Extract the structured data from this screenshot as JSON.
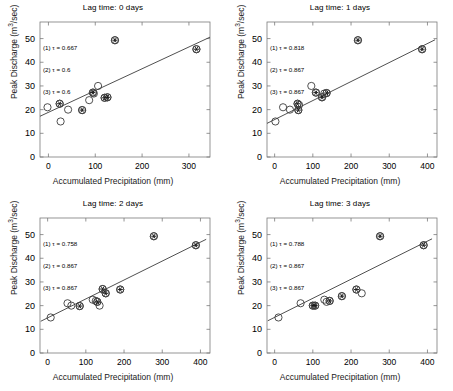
{
  "figure": {
    "panel_count": 4,
    "marker_colors": {
      "circle_stroke": "#3c3c3c",
      "asterisk": "#1a1a1a",
      "regression_line": "#3c3c3c",
      "axis": "#7a7a7a"
    }
  },
  "axes": {
    "xlabel": "Accumulated Precipitation (mm)",
    "ylabel_pre": "Peak Discharge (m",
    "ylabel_sup": "3",
    "ylabel_post": "/sec)"
  },
  "chart_data": [
    {
      "type": "scatter",
      "id": "panel-0",
      "title": "Lag time: 0 days",
      "xlabel": "Accumulated Precipitation (mm)",
      "ylabel": "Peak Discharge (m3/sec)",
      "xlim": [
        -18,
        345
      ],
      "ylim": [
        0,
        57
      ],
      "xticks": [
        0,
        100,
        200,
        300
      ],
      "yticks": [
        0,
        10,
        20,
        30,
        40,
        50
      ],
      "grid": false,
      "legend_position": "none",
      "annotations": [
        "(1) τ = 0.667",
        "(2) τ = 0.6",
        "(3) τ = 0.6"
      ],
      "regression_line": {
        "x": [
          -18,
          345
        ],
        "y": [
          17.2,
          50.6
        ]
      },
      "series": [
        {
          "name": "open-circle",
          "marker": "circle",
          "points": [
            {
              "x": -2,
              "y": 21.0
            },
            {
              "x": 26,
              "y": 15.0
            },
            {
              "x": 42,
              "y": 20.0
            },
            {
              "x": 87,
              "y": 24.0
            },
            {
              "x": 106,
              "y": 30.0
            },
            {
              "x": 95,
              "y": 27.2
            },
            {
              "x": 97,
              "y": 26.8
            },
            {
              "x": 120,
              "y": 25.0
            },
            {
              "x": 126,
              "y": 25.2
            },
            {
              "x": 24,
              "y": 22.5
            },
            {
              "x": 72,
              "y": 19.8
            },
            {
              "x": 142,
              "y": 49.3
            },
            {
              "x": 316,
              "y": 45.5
            }
          ]
        },
        {
          "name": "asterisk-overlay",
          "marker": "circle-asterisk",
          "points": [
            {
              "x": 24,
              "y": 22.5
            },
            {
              "x": 72,
              "y": 19.8
            },
            {
              "x": 95,
              "y": 27.2
            },
            {
              "x": 120,
              "y": 25.0
            },
            {
              "x": 126,
              "y": 25.2
            },
            {
              "x": 142,
              "y": 49.3
            },
            {
              "x": 316,
              "y": 45.5
            }
          ]
        }
      ]
    },
    {
      "type": "scatter",
      "id": "panel-1",
      "title": "Lag time: 1 days",
      "xlabel": "Accumulated Precipitation (mm)",
      "ylabel": "Peak Discharge (m3/sec)",
      "xlim": [
        -20,
        425
      ],
      "ylim": [
        0,
        57
      ],
      "xticks": [
        0,
        100,
        200,
        300,
        400
      ],
      "yticks": [
        0,
        10,
        20,
        30,
        40,
        50
      ],
      "grid": false,
      "legend_position": "none",
      "annotations": [
        "(1) τ = 0.818",
        "(2) τ = 0.867",
        "(3) τ = 0.867"
      ],
      "regression_line": {
        "x": [
          -20,
          420
        ],
        "y": [
          14.2,
          49.5
        ]
      },
      "series": [
        {
          "name": "open-circle",
          "marker": "circle",
          "points": [
            {
              "x": 2,
              "y": 15.0
            },
            {
              "x": 22,
              "y": 21.0
            },
            {
              "x": 40,
              "y": 20.0
            },
            {
              "x": 60,
              "y": 22.5
            },
            {
              "x": 64,
              "y": 22.0
            },
            {
              "x": 62,
              "y": 19.8
            },
            {
              "x": 108,
              "y": 27.2
            },
            {
              "x": 96,
              "y": 30.0
            },
            {
              "x": 124,
              "y": 25.2
            },
            {
              "x": 130,
              "y": 26.8
            },
            {
              "x": 136,
              "y": 27.0
            },
            {
              "x": 218,
              "y": 49.3
            },
            {
              "x": 386,
              "y": 45.5
            }
          ]
        },
        {
          "name": "asterisk-overlay",
          "marker": "circle-asterisk",
          "points": [
            {
              "x": 60,
              "y": 22.5
            },
            {
              "x": 62,
              "y": 19.8
            },
            {
              "x": 108,
              "y": 27.2
            },
            {
              "x": 124,
              "y": 25.2
            },
            {
              "x": 136,
              "y": 27.0
            },
            {
              "x": 218,
              "y": 49.3
            },
            {
              "x": 386,
              "y": 45.5
            }
          ]
        }
      ]
    },
    {
      "type": "scatter",
      "id": "panel-2",
      "title": "Lag time: 2 days",
      "xlabel": "Accumulated Precipitation (mm)",
      "ylabel": "Peak Discharge (m3/sec)",
      "xlim": [
        -20,
        425
      ],
      "ylim": [
        0,
        57
      ],
      "xticks": [
        0,
        100,
        200,
        300,
        400
      ],
      "yticks": [
        0,
        10,
        20,
        30,
        40,
        50
      ],
      "grid": false,
      "legend_position": "none",
      "annotations": [
        "(1) τ = 0.758",
        "(2) τ = 0.867",
        "(3) τ = 0.867"
      ],
      "regression_line": {
        "x": [
          -18,
          415
        ],
        "y": [
          13.4,
          48.0
        ]
      },
      "series": [
        {
          "name": "open-circle",
          "marker": "circle",
          "points": [
            {
              "x": 8,
              "y": 15.0
            },
            {
              "x": 52,
              "y": 21.0
            },
            {
              "x": 62,
              "y": 20.0
            },
            {
              "x": 84,
              "y": 19.8
            },
            {
              "x": 118,
              "y": 22.5
            },
            {
              "x": 126,
              "y": 22.0
            },
            {
              "x": 130,
              "y": 21.6
            },
            {
              "x": 136,
              "y": 20.0
            },
            {
              "x": 144,
              "y": 27.0
            },
            {
              "x": 152,
              "y": 25.2
            },
            {
              "x": 190,
              "y": 26.8
            },
            {
              "x": 278,
              "y": 49.3
            },
            {
              "x": 388,
              "y": 45.5
            }
          ]
        },
        {
          "name": "asterisk-overlay",
          "marker": "circle-asterisk",
          "points": [
            {
              "x": 84,
              "y": 19.8
            },
            {
              "x": 130,
              "y": 21.6
            },
            {
              "x": 144,
              "y": 27.0
            },
            {
              "x": 152,
              "y": 25.2
            },
            {
              "x": 190,
              "y": 26.8
            },
            {
              "x": 278,
              "y": 49.3
            },
            {
              "x": 388,
              "y": 45.5
            }
          ]
        }
      ]
    },
    {
      "type": "scatter",
      "id": "panel-3",
      "title": "Lag time: 3 days",
      "xlabel": "Accumulated Precipitation (mm)",
      "ylabel": "Peak Discharge (m3/sec)",
      "xlim": [
        -20,
        425
      ],
      "ylim": [
        0,
        57
      ],
      "xticks": [
        0,
        100,
        200,
        300,
        400
      ],
      "yticks": [
        0,
        10,
        20,
        30,
        40,
        50
      ],
      "grid": false,
      "legend_position": "none",
      "annotations": [
        "(1) τ = 0.788",
        "(2) τ = 0.867",
        "(3) τ = 0.867"
      ],
      "regression_line": {
        "x": [
          -18,
          412
        ],
        "y": [
          13.6,
          48.2
        ]
      },
      "series": [
        {
          "name": "open-circle",
          "marker": "circle",
          "points": [
            {
              "x": 10,
              "y": 15.0
            },
            {
              "x": 68,
              "y": 21.0
            },
            {
              "x": 100,
              "y": 20.0
            },
            {
              "x": 106,
              "y": 20.0
            },
            {
              "x": 130,
              "y": 22.5
            },
            {
              "x": 136,
              "y": 21.6
            },
            {
              "x": 144,
              "y": 22.0
            },
            {
              "x": 176,
              "y": 24.0
            },
            {
              "x": 214,
              "y": 26.8
            },
            {
              "x": 228,
              "y": 25.2
            },
            {
              "x": 276,
              "y": 49.3
            },
            {
              "x": 390,
              "y": 45.5
            }
          ]
        },
        {
          "name": "asterisk-overlay",
          "marker": "circle-asterisk",
          "points": [
            {
              "x": 100,
              "y": 20.0
            },
            {
              "x": 106,
              "y": 20.0
            },
            {
              "x": 144,
              "y": 22.0
            },
            {
              "x": 176,
              "y": 24.0
            },
            {
              "x": 214,
              "y": 26.8
            },
            {
              "x": 276,
              "y": 49.3
            },
            {
              "x": 390,
              "y": 45.5
            }
          ]
        }
      ]
    }
  ]
}
